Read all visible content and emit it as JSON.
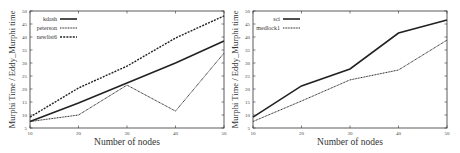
{
  "chart_data": [
    {
      "type": "line",
      "title": "",
      "xlabel": "Number of nodes",
      "ylabel": "Murphi Time / Eddy_Murphi time",
      "x": [
        10,
        20,
        30,
        40,
        50
      ],
      "xticks": [
        "10",
        "20",
        "30",
        "40",
        "50"
      ],
      "yticks": [
        "5",
        "10",
        "15",
        "20",
        "25",
        "30",
        "35",
        "40",
        "45",
        "50"
      ],
      "xlim": [
        10,
        50
      ],
      "ylim": [
        5,
        50
      ],
      "grid": false,
      "legend_position": "upper-left",
      "series": [
        {
          "name": "kdash",
          "style": "solid-thick",
          "values": [
            7.5,
            14.6,
            22.3,
            30.0,
            38.5
          ]
        },
        {
          "name": "peterson",
          "style": "dotted",
          "values": [
            7.5,
            10.0,
            21.5,
            11.5,
            33.8
          ]
        },
        {
          "name": "newlist6",
          "style": "dashed",
          "values": [
            9.2,
            20.4,
            28.8,
            39.6,
            48.1
          ]
        }
      ]
    },
    {
      "type": "line",
      "title": "",
      "xlabel": "Number of nodes",
      "ylabel": "Murphi Time / Eddy_Murphi time",
      "x": [
        10,
        20,
        30,
        40,
        50
      ],
      "xticks": [
        "10",
        "20",
        "30",
        "40",
        "50"
      ],
      "yticks": [
        "5",
        "10",
        "15",
        "20",
        "25",
        "30",
        "35",
        "40",
        "45",
        "50"
      ],
      "xlim": [
        10,
        50
      ],
      "ylim": [
        5,
        50
      ],
      "grid": false,
      "legend_position": "upper-left",
      "series": [
        {
          "name": "sci",
          "style": "solid-thick",
          "values": [
            9.2,
            21.2,
            27.7,
            41.5,
            46.5
          ]
        },
        {
          "name": "medlock1",
          "style": "dotted",
          "values": [
            7.5,
            15.4,
            23.5,
            27.3,
            38.8
          ]
        }
      ]
    }
  ],
  "colors": {
    "axis": "#333333",
    "line": "#222222",
    "background": "#ffffff"
  }
}
